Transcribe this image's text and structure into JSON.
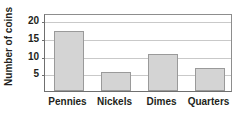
{
  "chart_data": {
    "type": "bar",
    "title": "",
    "subtitle": "",
    "xlabel": "",
    "ylabel": "Number of coins",
    "categories": [
      "Pennies",
      "Nickels",
      "Dimes",
      "Quarters"
    ],
    "values": [
      17,
      5.5,
      10.5,
      6.5
    ],
    "series": [
      {
        "name": "Number of coins",
        "values": [
          17,
          5.5,
          10.5,
          6.5
        ]
      }
    ],
    "ylim": [
      0,
      22
    ],
    "xlim": [
      0,
      4
    ],
    "y_ticks": [
      5,
      10,
      15,
      20
    ],
    "y_tick_labels": [
      "5",
      "10",
      "15",
      "20"
    ],
    "grid": true,
    "grid_axis": "y",
    "legend": false,
    "legend_position": "none",
    "bar_color": "#d4d4d4",
    "bar_edge_color": "#9a9a9a",
    "grid_color": "#c9c9c9",
    "axis_color": "#6f6f6f",
    "text_color": "#231f20",
    "background_color": "#ffffff",
    "annotations": []
  }
}
